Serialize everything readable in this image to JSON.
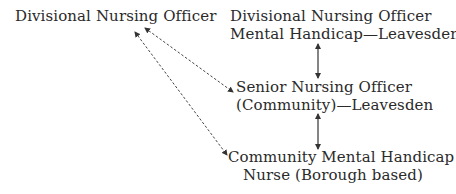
{
  "diagram": {
    "nodes": [
      {
        "id": "dno",
        "lines": [
          "Divisional Nursing Officer"
        ]
      },
      {
        "id": "dno-mh",
        "lines": [
          "Divisional Nursing Officer",
          "Mental Handicap—Leavesden"
        ]
      },
      {
        "id": "sno",
        "lines": [
          "Senior Nursing Officer",
          "(Community)—Leavesden"
        ]
      },
      {
        "id": "cmhn",
        "lines": [
          "Community Mental Handicap",
          "Nurse (Borough based)"
        ]
      }
    ],
    "edges": [
      {
        "from": "dno-mh",
        "to": "sno",
        "style": "solid",
        "direction": "both"
      },
      {
        "from": "sno",
        "to": "cmhn",
        "style": "solid",
        "direction": "both"
      },
      {
        "from": "dno",
        "to": "sno",
        "style": "dashed",
        "direction": "both"
      },
      {
        "from": "dno",
        "to": "cmhn",
        "style": "dashed",
        "direction": "both"
      }
    ],
    "colors": {
      "text": "#2a2a2a",
      "line": "#333333",
      "background": "#ffffff"
    }
  }
}
